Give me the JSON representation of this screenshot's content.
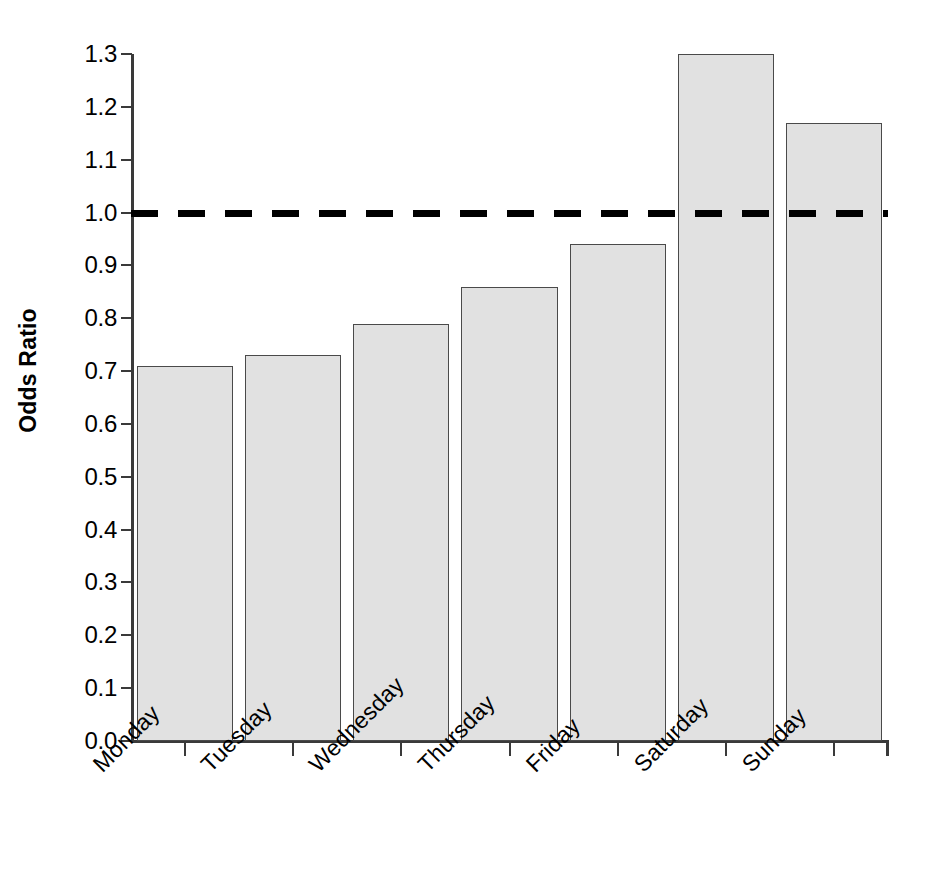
{
  "chart_data": {
    "type": "bar",
    "title": "",
    "xlabel": "",
    "ylabel": "Odds Ratio",
    "categories": [
      "Monday",
      "Tuesday",
      "Wednesday",
      "Thursday",
      "Friday",
      "Saturday",
      "Sunday"
    ],
    "values": [
      0.71,
      0.73,
      0.79,
      0.86,
      0.94,
      1.3,
      1.17
    ],
    "ylim": [
      0.0,
      1.3
    ],
    "ytick_labels": [
      "0.0",
      "0.1",
      "0.2",
      "0.3",
      "0.4",
      "0.5",
      "0.6",
      "0.7",
      "0.8",
      "0.9",
      "1.0",
      "1.1",
      "1.2",
      "1.3"
    ],
    "ytick_values": [
      0.0,
      0.1,
      0.2,
      0.3,
      0.4,
      0.5,
      0.6,
      0.7,
      0.8,
      0.9,
      1.0,
      1.1,
      1.2,
      1.3
    ],
    "grid": false,
    "legend": "none",
    "annotations": [
      {
        "name": "reference-line",
        "kind": "horizontal-dashed-line",
        "value": 1.0,
        "color": "#000000"
      }
    ],
    "style": {
      "bar_fill": "#e1e1e1",
      "bar_border": "#4a4a4a",
      "axis_color": "#3a3a3a",
      "text_color": "#000000",
      "background": "#ffffff",
      "xlabel_rotation_deg": -45
    }
  }
}
